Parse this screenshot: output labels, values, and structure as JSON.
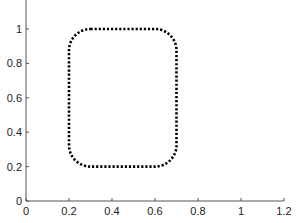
{
  "chart_data": {
    "type": "line",
    "title": "",
    "xlabel": "",
    "ylabel": "",
    "xlim": [
      0,
      1.2
    ],
    "ylim": [
      0,
      1.15
    ],
    "grid": false,
    "legend": null,
    "x_ticks": [
      "0",
      "0.2",
      "0.4",
      "0.6",
      "0.8",
      "1",
      "1.2"
    ],
    "y_ticks": [
      "0",
      "0.2",
      "0.4",
      "0.6",
      "0.8",
      "1"
    ],
    "series": [
      {
        "name": "rounded-rectangle",
        "style": "dotted",
        "color": "#000000",
        "shape": "rounded-rectangle",
        "x_range": [
          0.2,
          0.7
        ],
        "y_range": [
          0.2,
          1.0
        ],
        "corner_radius": 0.1
      }
    ]
  }
}
